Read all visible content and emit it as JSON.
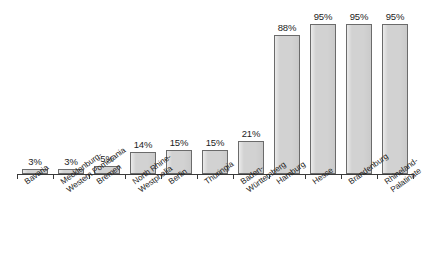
{
  "chart_data": {
    "type": "bar",
    "title": "",
    "subtitle": "",
    "xlabel": "",
    "ylabel": "",
    "ylim": [
      0,
      100
    ],
    "grid": false,
    "legend": "none",
    "value_suffix": "%",
    "axis_visible": true,
    "categories": [
      "Bavaria",
      "Mecklenburg-Western Pomerania",
      "Bremen",
      "North Rhine-Westphalia",
      "Berlin",
      "Thuringia",
      "Baden-Württemberg",
      "Hamburg",
      "Hesse",
      "Brandenburg",
      "Rhineland-Palatinate"
    ],
    "category_lines": [
      [
        "Bavaria",
        ""
      ],
      [
        "Mecklenburg-",
        "Western Pomerania"
      ],
      [
        "Bremen",
        ""
      ],
      [
        "North Rhine-",
        "Westphalia"
      ],
      [
        "Berlin",
        ""
      ],
      [
        "Thuringia",
        ""
      ],
      [
        "Baden-",
        "Württemberg"
      ],
      [
        "Hamburg",
        ""
      ],
      [
        "Hesse",
        ""
      ],
      [
        "Brandenburg",
        ""
      ],
      [
        "Rhineland-",
        "Palatinate"
      ]
    ],
    "values": [
      3,
      3,
      5,
      14,
      15,
      15,
      21,
      88,
      95,
      95,
      95
    ],
    "data_labels": [
      "3%",
      "3%",
      "5%",
      "14%",
      "15%",
      "15%",
      "21%",
      "88%",
      "95%",
      "95%",
      "95%"
    ],
    "colors": {
      "bar_fill": "#d2d2d2",
      "bar_border": "#6b6b6b",
      "axis": "#3a3a3a",
      "text": "#1d1d1d",
      "background": "#ffffff"
    }
  }
}
